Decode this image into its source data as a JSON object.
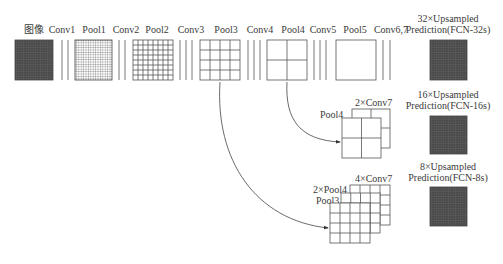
{
  "diagram": {
    "top_row_labels": [
      {
        "id": "image",
        "text": "图像",
        "x": 34
      },
      {
        "id": "conv1",
        "text": "Conv1",
        "x": 62
      },
      {
        "id": "pool1",
        "text": "Pool1",
        "x": 94
      },
      {
        "id": "conv2",
        "text": "Conv2",
        "x": 124
      },
      {
        "id": "pool2",
        "text": "Pool2",
        "x": 154
      },
      {
        "id": "conv3",
        "text": "Conv3",
        "x": 191
      },
      {
        "id": "pool3",
        "text": "Pool3",
        "x": 225
      },
      {
        "id": "conv4",
        "text": "Conv4",
        "x": 258
      },
      {
        "id": "pool4",
        "text": "Pool4",
        "x": 291
      },
      {
        "id": "conv5",
        "text": "Conv5",
        "x": 323
      },
      {
        "id": "pool5",
        "text": "Pool5",
        "x": 355
      },
      {
        "id": "conv67",
        "text": "Conv6,7",
        "x": 390
      }
    ],
    "predictions": [
      {
        "id": "fcn32",
        "line1": "32×Upsampled",
        "line2": "Prediction(FCN-32s)"
      },
      {
        "id": "fcn16",
        "line1": "16×Upsampled",
        "line2": "Prediction(FCN-16s)"
      },
      {
        "id": "fcn8",
        "line1": "8×Upsampled",
        "line2": "Prediction(FCN-8s)"
      }
    ],
    "fcn16_stack": {
      "front_label": "Pool4",
      "back_label": "2×Conv7"
    },
    "fcn8_stack": {
      "front_label": "Pool3",
      "middle_label": "2×Pool4",
      "back_label": "4×Conv7"
    },
    "colors": {
      "line": "#555555",
      "dark_square": "#4a4a4a",
      "dark_grid": "#6a6a6a"
    }
  }
}
